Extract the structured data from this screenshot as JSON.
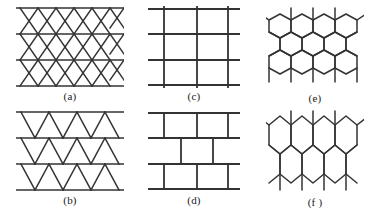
{
  "figure": {
    "background_color": "#ffffff",
    "line_color": "#333333",
    "label_color": "#1a1a1a",
    "width": 376,
    "height": 221
  },
  "panels": [
    {
      "id": "a",
      "label": "(a)",
      "lattice": "triangular",
      "description": "Triangular lattice: four horizontal rows crossed by two families of diagonals forming up and down triangles",
      "horizontal_lines": 4,
      "rows": 3,
      "columns": 3,
      "stroke_width": 1.6
    },
    {
      "id": "b",
      "label": "(b)",
      "lattice": "striped-triangular",
      "description": "Decoupled rows of downward-pointing triangles between horizontal lines",
      "horizontal_lines": 4,
      "bands": 3,
      "triangles_per_band": 3,
      "stroke_width": 1.6
    },
    {
      "id": "c",
      "label": "(c)",
      "lattice": "square",
      "description": "Square lattice: four horizontal lines crossed by three vertical lines",
      "horizontal_lines": 4,
      "vertical_lines": 3,
      "stroke_width": 1.8
    },
    {
      "id": "d",
      "label": "(d)",
      "lattice": "brick-wall",
      "description": "Brick-wall lattice: horizontal lines with staggered vertical bonds",
      "horizontal_lines": 4,
      "brick_rows": 3,
      "stroke_width": 1.8
    },
    {
      "id": "e",
      "label": "(e)",
      "lattice": "honeycomb-dense",
      "description": "Honeycomb lattice with three rows of small hexagons and dangling bonds at the edges",
      "hex_rows": 3,
      "hex_columns": 4,
      "stroke_width": 1.5
    },
    {
      "id": "f",
      "label": "(f )",
      "lattice": "honeycomb-coarse",
      "description": "Honeycomb lattice with two rows of larger hexagons and dangling bonds at the edges",
      "hex_rows": 2,
      "hex_columns": 4,
      "stroke_width": 1.5
    }
  ]
}
